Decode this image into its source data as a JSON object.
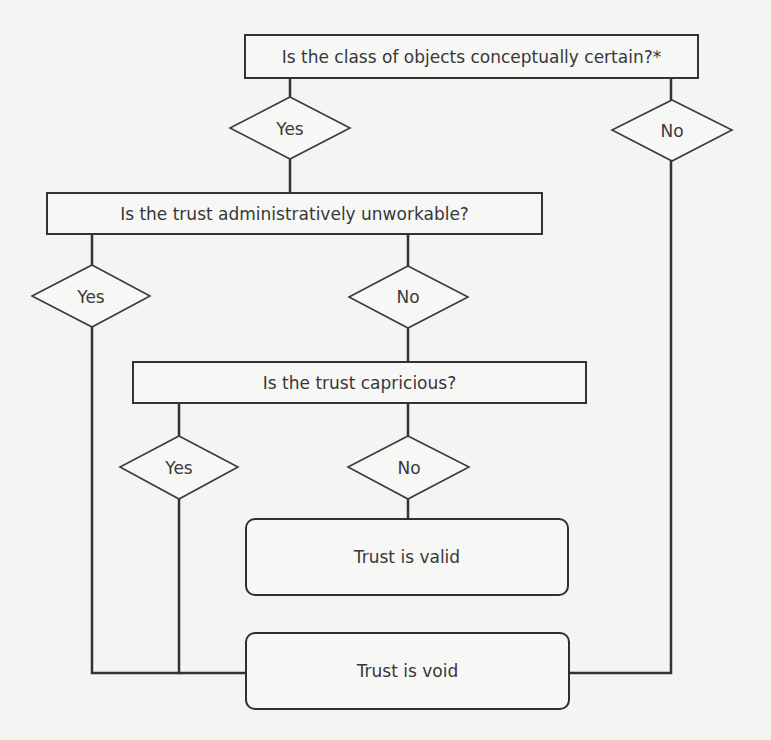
{
  "diagram": {
    "type": "flowchart",
    "questions": [
      {
        "id": "q1",
        "label": "Is the class of objects conceptually certain?*"
      },
      {
        "id": "q2",
        "label": "Is the trust administratively unworkable?"
      },
      {
        "id": "q3",
        "label": "Is the trust capricious?"
      }
    ],
    "answers": [
      {
        "id": "a1_yes",
        "label": "Yes"
      },
      {
        "id": "a1_no",
        "label": "No"
      },
      {
        "id": "a2_yes",
        "label": "Yes"
      },
      {
        "id": "a2_no",
        "label": "No"
      },
      {
        "id": "a3_yes",
        "label": "Yes"
      },
      {
        "id": "a3_no",
        "label": "No"
      }
    ],
    "outcomes": [
      {
        "id": "valid",
        "label": "Trust is valid"
      },
      {
        "id": "void",
        "label": "Trust is void"
      }
    ],
    "edges": [
      {
        "from": "q1",
        "via": "Yes",
        "to": "q2"
      },
      {
        "from": "q1",
        "via": "No",
        "to": "void"
      },
      {
        "from": "q2",
        "via": "Yes",
        "to": "void"
      },
      {
        "from": "q2",
        "via": "No",
        "to": "q3"
      },
      {
        "from": "q3",
        "via": "Yes",
        "to": "void"
      },
      {
        "from": "q3",
        "via": "No",
        "to": "valid"
      }
    ],
    "colors": {
      "line": "#333333",
      "text": "#383838",
      "background": "#f4f4f3"
    }
  }
}
